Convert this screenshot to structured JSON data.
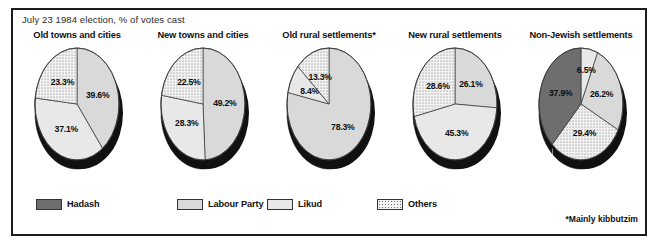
{
  "subtitle": "July 23 1984 election, % of votes cast",
  "footnote": "*Mainly kibbutzim",
  "colors": {
    "hadash": "#6e6e6e",
    "labour": "#d9d9d9",
    "likud": "#e8e8e8",
    "others": "#f2f2f2",
    "others_dot": "#6b6b6b",
    "outline": "#3a3a3a",
    "shadow": "#111111",
    "frame": "#1c1c1c",
    "text": "#111111"
  },
  "legend": {
    "items": [
      {
        "label": "Hadash",
        "key": "hadash"
      },
      {
        "label": "Labour Party",
        "key": "labour"
      },
      {
        "label": "Likud",
        "key": "likud"
      },
      {
        "label": "Others",
        "key": "others"
      }
    ]
  },
  "chart_data": {
    "type": "pie",
    "title": "",
    "subtitle": "July 23 1984 election, % of votes cast",
    "legend": [
      "Hadash",
      "Labour Party",
      "Likud",
      "Others"
    ],
    "legend_position": "bottom",
    "note": "*Mainly kibbutzim",
    "unit": "% of votes cast",
    "charts": [
      {
        "title": "Old towns and cities",
        "labels": [
          "Labour Party",
          "Likud",
          "Others"
        ],
        "values": [
          39.6,
          37.1,
          23.3
        ],
        "display": [
          "39.6%",
          "37.1%",
          "23.3%"
        ],
        "keys": [
          "labour",
          "likud",
          "others"
        ]
      },
      {
        "title": "New towns and cities",
        "labels": [
          "Labour Party",
          "Likud",
          "Others"
        ],
        "values": [
          49.2,
          28.3,
          22.5
        ],
        "display": [
          "49.2%",
          "28.3%",
          "22.5%"
        ],
        "keys": [
          "labour",
          "likud",
          "others"
        ]
      },
      {
        "title": "Old rural settlements*",
        "labels": [
          "Labour Party",
          "Likud",
          "Others"
        ],
        "values": [
          78.3,
          8.4,
          13.3
        ],
        "display": [
          "78.3%",
          "8.4%",
          "13.3%"
        ],
        "keys": [
          "labour",
          "likud",
          "others"
        ]
      },
      {
        "title": "New rural settlements",
        "labels": [
          "Labour Party",
          "Likud",
          "Others"
        ],
        "values": [
          26.1,
          45.3,
          28.6
        ],
        "display": [
          "26.1%",
          "45.3%",
          "28.6%"
        ],
        "keys": [
          "labour",
          "likud",
          "others"
        ]
      },
      {
        "title": "Non-Jewish settlements",
        "labels": [
          "Likud",
          "Labour Party",
          "Others",
          "Hadash"
        ],
        "values": [
          6.5,
          26.2,
          29.4,
          37.9
        ],
        "display": [
          "6.5%",
          "26.2%",
          "29.4%",
          "37.9%"
        ],
        "keys": [
          "likud",
          "labour",
          "others",
          "hadash"
        ]
      }
    ]
  }
}
